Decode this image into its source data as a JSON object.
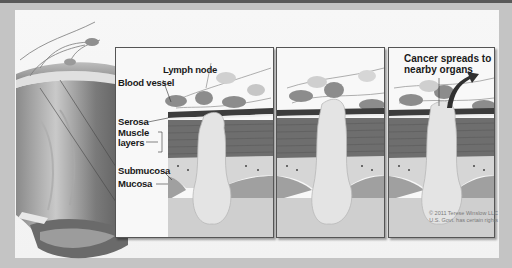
{
  "figure": {
    "panels": [
      {
        "id": "panel-1",
        "labels": {
          "lymph_node": "Lymph node",
          "blood_vessel": "Blood vessel",
          "serosa": "Serosa",
          "muscle_layers_line1": "Muscle",
          "muscle_layers_line2": "layers",
          "submucosa": "Submucosa",
          "mucosa": "Mucosa"
        }
      },
      {
        "id": "panel-2"
      },
      {
        "id": "panel-3",
        "callout_line1": "Cancer spreads to",
        "callout_line2": "nearby organs"
      }
    ],
    "copyright_line1": "© 2011 Terese Winslow LLC",
    "copyright_line2": "U.S. Govt. has certain rights"
  },
  "colors": {
    "frame": "#c4c4c4",
    "canvas": "#f4f4f4",
    "panel_border": "#555555",
    "muscle": "#6b6b6b",
    "submucosa": "#d4d4d4",
    "mucosa": "#9a9a9a",
    "tumor": "#e6e6e6",
    "lymph_node": "#8a8a8a"
  }
}
